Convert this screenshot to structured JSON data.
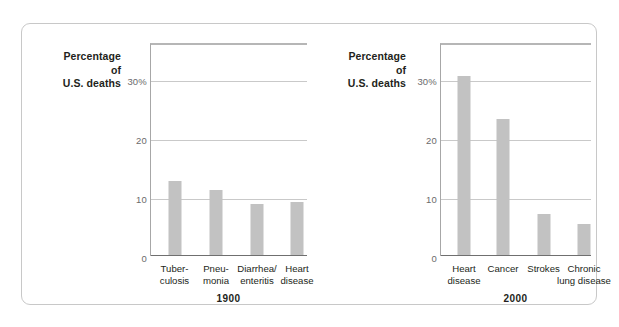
{
  "figure": {
    "axis_caption_lines": [
      "Percentage",
      "of",
      "U.S. deaths"
    ],
    "callout_text": "Unlike many leading killers a century ago, today's major killers are more life-style–related"
  },
  "chart_data": [
    {
      "type": "bar",
      "title": "1900",
      "xlabel": "",
      "ylabel": "Percentage of U.S. deaths",
      "categories": [
        "Tuber-\nculosis",
        "Pneu-\nmonia",
        "Diarrhea/\nenteritis",
        "Heart\ndisease"
      ],
      "values": [
        12.5,
        11.0,
        8.7,
        9.0
      ],
      "ylim": [
        0,
        36
      ],
      "yticks": [
        0,
        10,
        20,
        30
      ],
      "ytick_labels": [
        "0",
        "10",
        "20",
        "30%"
      ],
      "grid": true,
      "legend": "none",
      "bar_color": "#c2c2c2"
    },
    {
      "type": "bar",
      "title": "2000",
      "xlabel": "",
      "ylabel": "Percentage of U.S. deaths",
      "categories": [
        "Heart\ndisease",
        "Cancer",
        "Strokes",
        "Chronic\nlung disease"
      ],
      "values": [
        30.3,
        23.0,
        7.0,
        5.3
      ],
      "ylim": [
        0,
        36
      ],
      "yticks": [
        0,
        10,
        20,
        30
      ],
      "ytick_labels": [
        "0",
        "10",
        "20",
        "30%"
      ],
      "grid": true,
      "legend": "none",
      "annotations": [
        "Unlike many leading killers a century ago, today's major killers are more life-style–related"
      ],
      "bar_color": "#c2c2c2"
    }
  ],
  "panels": [
    {
      "year": "1900",
      "ticks": [
        {
          "label": "30%",
          "value": 30
        },
        {
          "label": "20",
          "value": 20
        },
        {
          "label": "10",
          "value": 10
        },
        {
          "label": "0",
          "value": 0
        }
      ],
      "bars": [
        {
          "label_line1": "Tuber-",
          "label_line2": "culosis",
          "value": 12.5
        },
        {
          "label_line1": "Pneu-",
          "label_line2": "monia",
          "value": 11.0
        },
        {
          "label_line1": "Diarrhea/",
          "label_line2": "enteritis",
          "value": 8.7
        },
        {
          "label_line1": "Heart",
          "label_line2": "disease",
          "value": 9.0
        }
      ]
    },
    {
      "year": "2000",
      "ticks": [
        {
          "label": "30%",
          "value": 30
        },
        {
          "label": "20",
          "value": 20
        },
        {
          "label": "10",
          "value": 10
        },
        {
          "label": "0",
          "value": 0
        }
      ],
      "bars": [
        {
          "label_line1": "Heart",
          "label_line2": "disease",
          "value": 30.3
        },
        {
          "label_line1": "Cancer",
          "label_line2": "",
          "value": 23.0
        },
        {
          "label_line1": "Strokes",
          "label_line2": "",
          "value": 7.0
        },
        {
          "label_line1": "Chronic",
          "label_line2": "lung disease",
          "value": 5.3
        }
      ]
    }
  ]
}
